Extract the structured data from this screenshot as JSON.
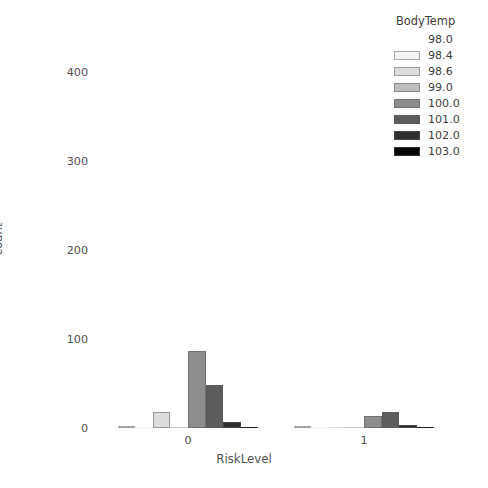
{
  "chart_data": {
    "type": "bar",
    "title": "",
    "xlabel": "RiskLevel",
    "ylabel": "count",
    "categories": [
      "0",
      "1"
    ],
    "xtick_labels": [
      "0",
      "1"
    ],
    "ytick_labels": [
      "0",
      "100",
      "200",
      "300",
      "400"
    ],
    "ytick_values": [
      0,
      100,
      200,
      300,
      400
    ],
    "ylim": [
      0,
      440
    ],
    "grid": false,
    "legend_position": "upper right",
    "legend_title": "BodyTemp",
    "series": [
      {
        "name": "98.0",
        "color": "#ffffff",
        "values": [
          2,
          2
        ]
      },
      {
        "name": "98.4",
        "color": "#f4f4f4",
        "values": [
          0,
          0
        ]
      },
      {
        "name": "98.6",
        "color": "#dcdcdc",
        "values": [
          18,
          0
        ]
      },
      {
        "name": "99.0",
        "color": "#bdbdbd",
        "values": [
          0,
          0
        ]
      },
      {
        "name": "100.0",
        "color": "#8d8d8d",
        "values": [
          86,
          14
        ]
      },
      {
        "name": "101.0",
        "color": "#5c5c5c",
        "values": [
          48,
          18
        ]
      },
      {
        "name": "102.0",
        "color": "#2e2e2e",
        "values": [
          7,
          3
        ]
      },
      {
        "name": "103.0",
        "color": "#050505",
        "values": [
          0,
          0
        ]
      }
    ]
  }
}
